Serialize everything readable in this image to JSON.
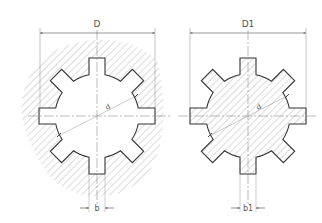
{
  "figure": {
    "type": "technical-drawing",
    "colors": {
      "line": "#333333",
      "hatch": "#9a9a9a",
      "dim": "#666666",
      "background": "#ffffff"
    }
  },
  "hub": {
    "name": "hub-section",
    "center": [
      97,
      116
    ],
    "outer_radius": 58,
    "inner_radius": 42,
    "spline_count": 8,
    "spline_half_width": 8,
    "labels": {
      "outer_diameter": "D",
      "inner_diameter": "d",
      "spline_width": "b"
    }
  },
  "shaft": {
    "name": "shaft-section",
    "center": [
      248,
      116
    ],
    "outer_radius": 58,
    "inner_radius": 42,
    "spline_count": 8,
    "spline_half_width": 8,
    "labels": {
      "outer_diameter": "D1",
      "inner_diameter": "d",
      "spline_width": "b1"
    }
  }
}
